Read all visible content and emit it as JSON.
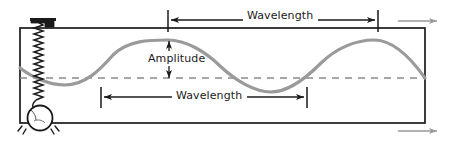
{
  "figure": {
    "type": "wave-diagram",
    "background_color": "#ffffff",
    "box": {
      "x": 20,
      "y": 28,
      "width": 405,
      "height": 95,
      "stroke": "#1a1a1a",
      "stroke_width": 1.6
    },
    "equilibrium_line": {
      "label": "dashed-center-line",
      "y": 78,
      "x_start": 20,
      "x_end": 425,
      "color": "#8a8a8a",
      "dash": "7 6"
    },
    "wave": {
      "color": "#9a9a9a",
      "stroke_width": 3.2,
      "amplitude_px": 38,
      "wavelength_px": 206,
      "baseline_y": 78,
      "x_start": 20,
      "x_end": 425,
      "peaks_x": [
        168,
        374
      ],
      "troughs_x": [
        65,
        271
      ],
      "phase": "starts near trough at left edge"
    },
    "spring": {
      "name": "coil-spring",
      "top_x": 38,
      "top_y": 24,
      "bottom_y": 104,
      "coil_count": 22,
      "coil_width": 9,
      "color": "#1a1a1a"
    },
    "bob": {
      "name": "hanging-mass",
      "cx": 40,
      "cy": 118,
      "r": 12,
      "color": "#1a1a1a",
      "fill": "#ffffff",
      "motion_lines": true
    },
    "bracket": {
      "name": "spring-mount-bracket",
      "x": 32,
      "y": 19,
      "width": 22,
      "height": 8
    }
  },
  "labels": {
    "wavelength_top": "Wavelength",
    "wavelength_bottom": "Wavelength",
    "amplitude": "Amplitude"
  },
  "measures": [
    {
      "id": "wavelength-top",
      "label": "Wavelength",
      "orientation": "horizontal",
      "y": 20,
      "x_start": 168,
      "x_end": 378,
      "length_px": 210,
      "tick_marks": true,
      "arrow_heads": "both",
      "color": "#1a1a1a"
    },
    {
      "id": "wavelength-bottom",
      "label": "Wavelength",
      "orientation": "horizontal",
      "y": 97,
      "x_start": 101,
      "x_end": 307,
      "length_px": 206,
      "tick_marks": true,
      "arrow_heads": "both",
      "color": "#1a1a1a"
    },
    {
      "id": "amplitude",
      "label": "Amplitude",
      "orientation": "vertical",
      "x": 169,
      "y_start": 41,
      "y_end": 78,
      "length_px": 37,
      "arrow_heads": "both",
      "color": "#1a1a1a"
    }
  ],
  "direction_arrows": [
    {
      "id": "propagation-arrow-top",
      "x_start": 398,
      "x_end": 438,
      "y": 21,
      "color": "#9a9a9a",
      "points": "right"
    },
    {
      "id": "propagation-arrow-bottom",
      "x_start": 398,
      "x_end": 438,
      "y": 131,
      "color": "#9a9a9a",
      "points": "right"
    }
  ],
  "colors": {
    "ink": "#1a1a1a",
    "wave": "#9a9a9a",
    "dash": "#8a8a8a",
    "gray_arrow": "#9a9a9a",
    "background": "#ffffff"
  }
}
